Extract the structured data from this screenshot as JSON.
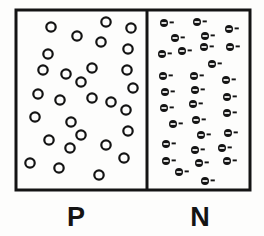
{
  "figure": {
    "background_color": "#fdfdfc",
    "ink_color": "#141414",
    "outer_box": {
      "x": 16,
      "y": 10,
      "width": 234,
      "height": 180,
      "stroke_width": 3
    },
    "divider": {
      "x": 147,
      "y1": 10,
      "y2": 190,
      "stroke_width": 3
    }
  },
  "regions": [
    {
      "id": "p-region",
      "label": "P",
      "label_x": 76,
      "label_y": 226,
      "carrier_type": "hole",
      "carrier_symbol": "O",
      "carrier_count": 27,
      "carrier_radius": 4.7,
      "carrier_stroke": 2.2,
      "carrier_fill": "none",
      "carriers": [
        {
          "x": 51,
          "y": 27
        },
        {
          "x": 106,
          "y": 22
        },
        {
          "x": 131,
          "y": 28
        },
        {
          "x": 77,
          "y": 36
        },
        {
          "x": 101,
          "y": 42
        },
        {
          "x": 48,
          "y": 54
        },
        {
          "x": 128,
          "y": 49
        },
        {
          "x": 43,
          "y": 70
        },
        {
          "x": 66,
          "y": 74
        },
        {
          "x": 92,
          "y": 68
        },
        {
          "x": 127,
          "y": 70
        },
        {
          "x": 81,
          "y": 82
        },
        {
          "x": 133,
          "y": 88
        },
        {
          "x": 38,
          "y": 94
        },
        {
          "x": 60,
          "y": 100
        },
        {
          "x": 92,
          "y": 98
        },
        {
          "x": 111,
          "y": 102
        },
        {
          "x": 35,
          "y": 117
        },
        {
          "x": 71,
          "y": 122
        },
        {
          "x": 126,
          "y": 110
        },
        {
          "x": 128,
          "y": 131
        },
        {
          "x": 49,
          "y": 140
        },
        {
          "x": 81,
          "y": 135
        },
        {
          "x": 70,
          "y": 148
        },
        {
          "x": 106,
          "y": 145
        },
        {
          "x": 30,
          "y": 163
        },
        {
          "x": 59,
          "y": 168
        },
        {
          "x": 99,
          "y": 175
        },
        {
          "x": 124,
          "y": 158
        }
      ]
    },
    {
      "id": "n-region",
      "label": "N",
      "label_x": 200,
      "label_y": 226,
      "carrier_type": "electron",
      "carrier_symbol": "⊖-",
      "carrier_count": 32,
      "carrier_radius": 4.0,
      "carrier_fill": "#141414",
      "carrier_minus_color": "#fdfdfc",
      "carrier_dash_length": 4.2,
      "carriers": [
        {
          "x": 164,
          "y": 23
        },
        {
          "x": 197,
          "y": 22
        },
        {
          "x": 229,
          "y": 29
        },
        {
          "x": 175,
          "y": 38
        },
        {
          "x": 205,
          "y": 36
        },
        {
          "x": 162,
          "y": 54
        },
        {
          "x": 182,
          "y": 51
        },
        {
          "x": 204,
          "y": 47
        },
        {
          "x": 230,
          "y": 47
        },
        {
          "x": 212,
          "y": 64
        },
        {
          "x": 163,
          "y": 76
        },
        {
          "x": 194,
          "y": 76
        },
        {
          "x": 226,
          "y": 80
        },
        {
          "x": 165,
          "y": 92
        },
        {
          "x": 195,
          "y": 90
        },
        {
          "x": 227,
          "y": 97
        },
        {
          "x": 164,
          "y": 108
        },
        {
          "x": 193,
          "y": 104
        },
        {
          "x": 227,
          "y": 113
        },
        {
          "x": 196,
          "y": 120
        },
        {
          "x": 173,
          "y": 124
        },
        {
          "x": 201,
          "y": 135
        },
        {
          "x": 228,
          "y": 133
        },
        {
          "x": 166,
          "y": 144
        },
        {
          "x": 195,
          "y": 150
        },
        {
          "x": 222,
          "y": 148
        },
        {
          "x": 166,
          "y": 161
        },
        {
          "x": 199,
          "y": 163
        },
        {
          "x": 227,
          "y": 161
        },
        {
          "x": 179,
          "y": 172
        },
        {
          "x": 205,
          "y": 181
        }
      ]
    }
  ]
}
